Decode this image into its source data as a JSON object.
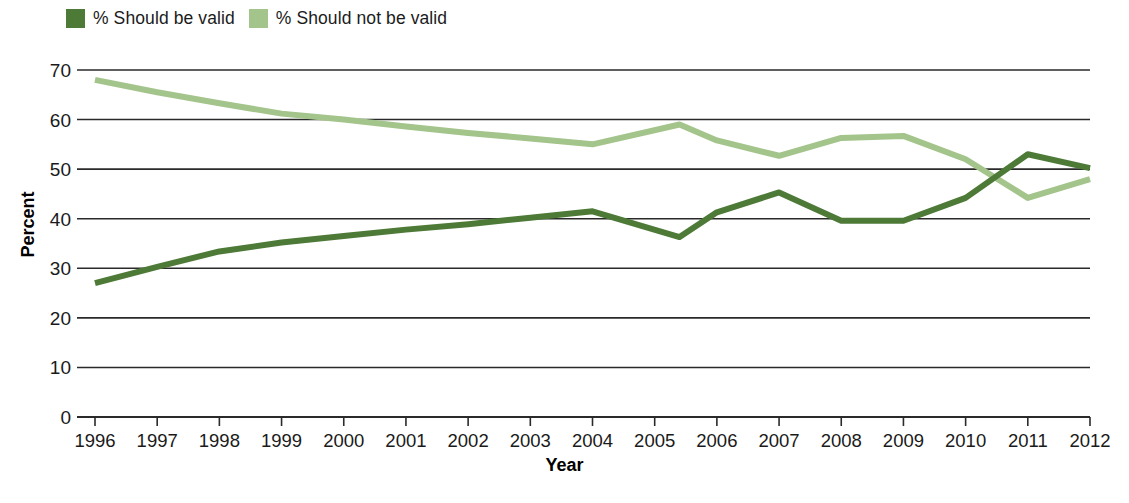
{
  "legend": {
    "position": "top-left",
    "items": [
      {
        "label": "% Should be valid",
        "color": "#4e7a38",
        "swatch_name": "legend-swatch-should-be-valid"
      },
      {
        "label": "% Should not be valid",
        "color": "#a3c48a",
        "swatch_name": "legend-swatch-should-not-be-valid"
      }
    ]
  },
  "axes": {
    "y_title": "Percent",
    "x_title": "Year",
    "y_ticks": [
      "0",
      "10",
      "20",
      "30",
      "40",
      "50",
      "60",
      "70"
    ],
    "x_ticks": [
      "1996",
      "1997",
      "1998",
      "1999",
      "2000",
      "2001",
      "2002",
      "2003",
      "2004",
      "2005",
      "2006",
      "2007",
      "2008",
      "2009",
      "2010",
      "2011",
      "2012"
    ]
  },
  "colors": {
    "dark_green": "#4e7a38",
    "light_green": "#a3c48a",
    "gridline": "#2a2a2a",
    "background": "#ffffff"
  },
  "chart_data": {
    "type": "line",
    "title": "",
    "xlabel": "Year",
    "ylabel": "Percent",
    "xlim": [
      1996,
      2012
    ],
    "ylim": [
      0,
      70
    ],
    "grid": true,
    "legend_position": "top-left",
    "x": [
      1996,
      1997,
      1998,
      1999,
      2000,
      2001,
      2002,
      2003,
      2004,
      2005.4,
      2006,
      2007,
      2008,
      2009,
      2010,
      2011,
      2012
    ],
    "series": [
      {
        "name": "% Should be valid",
        "color": "#4e7a38",
        "values": [
          27.0,
          30.3,
          33.4,
          35.2,
          36.5,
          37.8,
          38.9,
          40.2,
          41.5,
          36.3,
          41.3,
          45.3,
          39.6,
          39.6,
          44.2,
          53.0,
          50.2
        ]
      },
      {
        "name": "% Should not be valid",
        "color": "#a3c48a",
        "values": [
          68.0,
          65.5,
          63.3,
          61.2,
          60.0,
          58.6,
          57.3,
          56.2,
          55.0,
          59.0,
          55.8,
          52.7,
          56.3,
          56.7,
          52.0,
          44.2,
          48.0
        ]
      }
    ]
  }
}
